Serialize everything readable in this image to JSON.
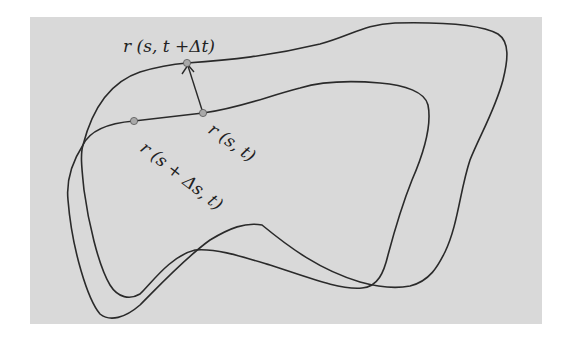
{
  "diagram": {
    "colors": {
      "background_panel": "#d9d9d9",
      "curve_stroke": "#2a2a2a",
      "point_fill": "#a8a8a8"
    },
    "labels": {
      "point_top": "r (s, t +Δt)",
      "point_center": "r (s, t)",
      "point_left": "r (s + Δs, t)"
    },
    "points": [
      {
        "name": "r(s,t+Δt)",
        "x": 187,
        "y": 63
      },
      {
        "name": "r(s,t)",
        "x": 203,
        "y": 113
      },
      {
        "name": "r(s+Δs,t)",
        "x": 134,
        "y": 121
      }
    ],
    "arrow": {
      "from": "r(s,t)",
      "to": "r(s,t+Δt)"
    }
  }
}
